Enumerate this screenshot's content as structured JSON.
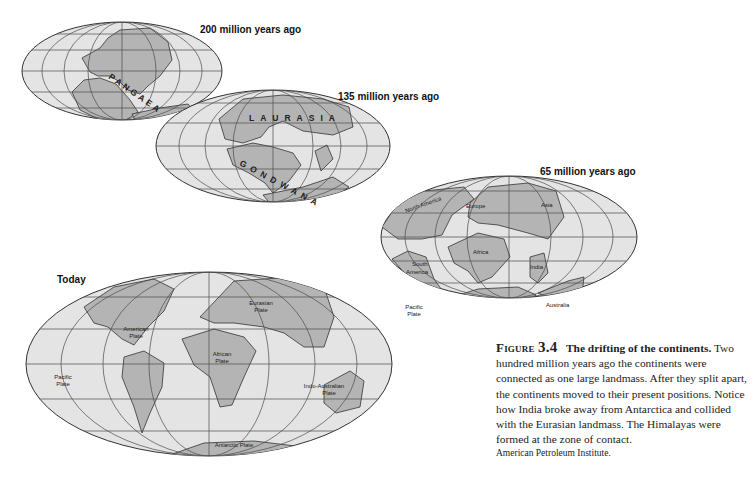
{
  "figure": {
    "maps": [
      {
        "id": "200mya",
        "label": "200 million years ago",
        "supercontinent": "PANGAEA",
        "letters": [
          "P",
          "A",
          "N",
          "G",
          "A",
          "E",
          "A"
        ]
      },
      {
        "id": "135mya",
        "label": "135 million years ago",
        "landmasses": [
          "LAURASIA",
          "GONDWANA"
        ],
        "laurasia_letters": [
          "L",
          "A",
          "U",
          "R",
          "A",
          "S",
          "I",
          "A"
        ],
        "gondwana_letters": [
          "G",
          "O",
          "N",
          "D",
          "W",
          "A",
          "N",
          "A"
        ]
      },
      {
        "id": "65mya",
        "label": "65 million years ago",
        "continents": [
          "North America",
          "Europe",
          "Asia",
          "Africa",
          "South America",
          "India",
          "Australia",
          "Antarctica"
        ]
      },
      {
        "id": "today",
        "label": "Today",
        "plates": [
          "Eurasian Plate",
          "American Plate",
          "African Plate",
          "Pacific Plate",
          "Indo-Australian Plate",
          "Antarctic Plate",
          "Pacific Plate"
        ]
      }
    ],
    "labels_65": {
      "north_america": "North America",
      "europe": "Europe",
      "asia": "Asia",
      "africa": "Africa",
      "south_america_1": "South",
      "south_america_2": "America",
      "india": "India",
      "australia": "Australia",
      "antarctica": "Antarctica"
    },
    "labels_today": {
      "eurasian_1": "Eurasian",
      "eurasian_2": "Plate",
      "american_1": "American",
      "american_2": "Plate",
      "african_1": "African",
      "african_2": "Plate",
      "pacific_w_1": "Pacific",
      "pacific_w_2": "Plate",
      "pacific_e_1": "Pacific",
      "pacific_e_2": "Plate",
      "indo_1": "Indo-Australian",
      "indo_2": "Plate",
      "antarctic": "Antarctic Plate"
    },
    "caption": {
      "number_prefix": "Figure",
      "number": "3.4",
      "title": "The drifting of the continents.",
      "body": "Two hundred million years ago the continents were connected as one large landmass. After they split apart, the continents moved to their present positions. Notice how India broke away from Antarctica and collided with the Eurasian landmass. The Himalayas were formed at the zone of contact.",
      "credit": "American Petroleum Institute."
    },
    "colors": {
      "ocean": "#e4e4e4",
      "land": "#b4b4b4",
      "grid": "#4a4a4a",
      "outline": "#333333"
    }
  }
}
